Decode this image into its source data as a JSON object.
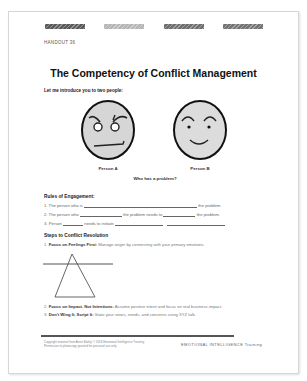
{
  "document": {
    "header_bars": [
      {
        "color": "#5a5a5a"
      },
      {
        "color": "#b5b5b5"
      },
      {
        "color": "#6e6e6e"
      },
      {
        "color": "#737373"
      }
    ],
    "handout_label": "HANDOUT 36",
    "title": "The Competency of Conflict Management",
    "intro": "Let me introduce you to two people:",
    "faces": [
      {
        "label": "Person A",
        "expression": "angry-face-icon"
      },
      {
        "label": "Person B",
        "expression": "smiling-face-icon"
      }
    ],
    "question": "Who has a problem?",
    "rules": {
      "heading": "Rules of Engagement:",
      "items": [
        {
          "num": "1.",
          "a": "The person who is",
          "b": "the problem."
        },
        {
          "num": "2.",
          "a": "The person who",
          "b": "the problem needs to",
          "c": "the problem."
        },
        {
          "num": "3.",
          "a": "Person",
          "b": "needs to initiate"
        }
      ]
    },
    "steps": {
      "heading": "Steps to Conflict Resolution",
      "items": [
        {
          "num": "1.",
          "bold": "Focus on Feelings First:",
          "text": "Manage anger by connecting with your primary emotions."
        },
        {
          "num": "2.",
          "bold": "Focus on Impact, Not Intentions:",
          "text": "Assume positive intent and focus on real business impact."
        },
        {
          "num": "3.",
          "bold": "Don't Wing It, Script It:",
          "text": "State your views, needs, and concerns using XYZ talk."
        }
      ]
    },
    "footer": {
      "left_line1": "Copyright material from Anne Bailey © 2018 Emotional Intelligence Training",
      "left_line2": "Permission to photocopy granted for personal use only.",
      "right": "EMOTIONAL INTELLIGENCE Training"
    }
  }
}
